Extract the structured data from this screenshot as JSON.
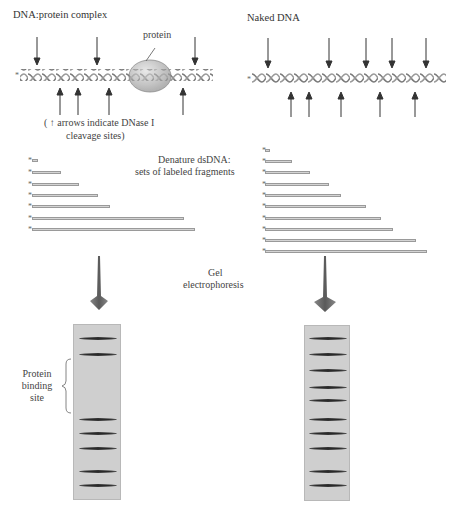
{
  "panels": {
    "left": {
      "title": "DNA:protein complex",
      "protein_label": "protein",
      "legend_line1": "( ↑ arrows indicate DNase I",
      "legend_line2": "cleavage sites)",
      "down_arrows_x": [
        37,
        97,
        195
      ],
      "up_arrows_x": [
        60,
        78,
        109,
        183
      ],
      "fragment_lengths": [
        6,
        29,
        48,
        67,
        79,
        153,
        164
      ],
      "gel_bands_y": [
        337,
        353,
        418,
        432,
        447,
        470,
        484
      ],
      "binding_site_label": [
        "Protein",
        "binding",
        "site"
      ]
    },
    "right": {
      "title": "Naked DNA",
      "down_arrows_x": [
        268,
        329,
        366,
        392,
        426
      ],
      "up_arrows_x": [
        291,
        309,
        341,
        380,
        415
      ],
      "fragment_lengths": [
        5,
        27,
        45,
        64,
        76,
        101,
        116,
        128,
        151,
        162
      ],
      "gel_bands_y": [
        337,
        353,
        370,
        387,
        400,
        419,
        433,
        448,
        471,
        485
      ]
    }
  },
  "center_labels": {
    "denature_line1": "Denature dsDNA:",
    "denature_line2": "sets of labeled fragments",
    "gel_line1": "Gel",
    "gel_line2": "electrophoresis"
  },
  "colors": {
    "gel_bg": "#cfcfcf",
    "band": "#2a2a2a",
    "arrow_fill": "#6a6a6a",
    "protein_fill": "#c8c8c8",
    "fragment_fill": "#d4d4d4"
  }
}
